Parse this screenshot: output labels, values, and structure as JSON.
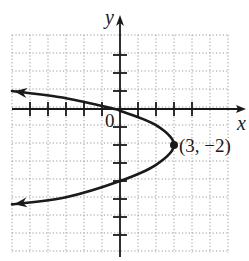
{
  "chart_data": {
    "type": "line",
    "title": "",
    "xlabel": "x",
    "ylabel": "y",
    "origin_label": "0",
    "xlim": [
      -6,
      6
    ],
    "ylim": [
      -8,
      4
    ],
    "grid": true,
    "grid_style": "dotted",
    "x_ticks": [
      -5,
      -4,
      -3,
      -2,
      -1,
      1,
      2,
      3,
      4
    ],
    "y_ticks": [
      3,
      2,
      1,
      -1,
      -2,
      -3,
      -4,
      -5,
      -6,
      -7
    ],
    "series": [
      {
        "name": "parabola",
        "equation": "x = -(3/4)(y + 2)^2 + 3",
        "arrows": "both ends",
        "points": [
          {
            "x": -6,
            "y": 1.0
          },
          {
            "x": -3,
            "y": 0.6
          },
          {
            "x": -0.3,
            "y": 0.0
          },
          {
            "x": 0,
            "y": -0.1
          },
          {
            "x": 2,
            "y": -0.9
          },
          {
            "x": 3,
            "y": -2
          },
          {
            "x": 2,
            "y": -3.1
          },
          {
            "x": 0,
            "y": -4
          },
          {
            "x": -3,
            "y": -4.9
          },
          {
            "x": -6,
            "y": -5.3
          }
        ]
      }
    ],
    "annotations": [
      {
        "point": {
          "x": 3,
          "y": -2
        },
        "text": "(3, −2)",
        "marker": "filled-dot"
      }
    ]
  },
  "graph": {
    "x_axis_label": "x",
    "y_axis_label": "y",
    "origin_label": "0",
    "vertex_label": "(3, −2)"
  }
}
